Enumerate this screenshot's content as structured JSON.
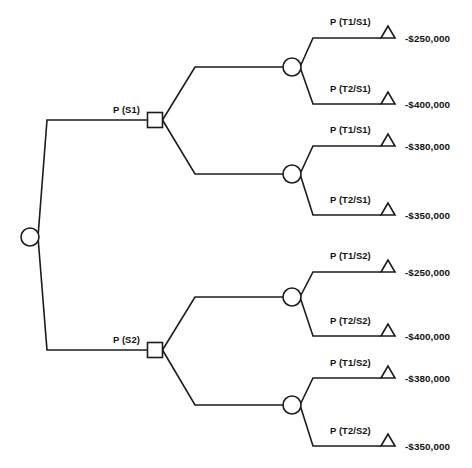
{
  "diagram": {
    "type": "decision-tree",
    "stroke_color": "#1c1c1c",
    "fill_color": "#ffffff",
    "text_color": "#111111",
    "root": {
      "node_name": "root-chance-node",
      "shape": "circle",
      "x": 30,
      "y": 237,
      "r": 9
    },
    "branches": [
      {
        "id": "s1",
        "label": "P (S1)",
        "label_x": 113,
        "label_y": 113,
        "decision_node": {
          "node_name": "decision-node-s1",
          "shape": "square",
          "x": 155,
          "y": 120,
          "size": 15
        },
        "elbow_x": 47,
        "elbow_y": 120,
        "chance_nodes": [
          {
            "node_name": "chance-node-s1-a",
            "shape": "circle",
            "x": 292,
            "y": 67,
            "r": 9,
            "fan_x": 195,
            "outcomes": [
              {
                "node_name": "terminal-s1-t1",
                "label": "P (T1/S1)",
                "label_x": 330,
                "label_y": 25,
                "payoff": "-$250,000",
                "payoff_x": 405,
                "payoff_y": 42,
                "y": 38,
                "corner_x": 313,
                "triangle_x": 388
              },
              {
                "node_name": "terminal-s1-t2",
                "label": "P (T2/S1)",
                "label_x": 330,
                "label_y": 92,
                "payoff": "-$400,000",
                "payoff_x": 405,
                "payoff_y": 108,
                "y": 104,
                "corner_x": 313,
                "triangle_x": 388
              }
            ]
          },
          {
            "node_name": "chance-node-s1-b",
            "shape": "circle",
            "x": 292,
            "y": 174,
            "r": 9,
            "fan_x": 195,
            "outcomes": [
              {
                "node_name": "terminal-s1-t3",
                "label": "P (T1/S1)",
                "label_x": 330,
                "label_y": 133,
                "payoff": "-$380,000",
                "payoff_x": 405,
                "payoff_y": 150,
                "y": 146,
                "corner_x": 313,
                "triangle_x": 388
              },
              {
                "node_name": "terminal-s1-t4",
                "label": "P (T2/S1)",
                "label_x": 330,
                "label_y": 203,
                "payoff": "-$350,000",
                "payoff_x": 405,
                "payoff_y": 219,
                "y": 215,
                "corner_x": 313,
                "triangle_x": 388
              }
            ]
          }
        ]
      },
      {
        "id": "s2",
        "label": "P (S2)",
        "label_x": 113,
        "label_y": 343,
        "decision_node": {
          "node_name": "decision-node-s2",
          "shape": "square",
          "x": 155,
          "y": 350,
          "size": 15
        },
        "elbow_x": 47,
        "elbow_y": 350,
        "chance_nodes": [
          {
            "node_name": "chance-node-s2-a",
            "shape": "circle",
            "x": 292,
            "y": 297,
            "r": 9,
            "fan_x": 195,
            "outcomes": [
              {
                "node_name": "terminal-s2-t1",
                "label": "P (T1/S2)",
                "label_x": 330,
                "label_y": 259,
                "payoff": "-$250,000",
                "payoff_x": 405,
                "payoff_y": 276,
                "y": 272,
                "corner_x": 313,
                "triangle_x": 388
              },
              {
                "node_name": "terminal-s2-t2",
                "label": "P (T2/S2)",
                "label_x": 330,
                "label_y": 324,
                "payoff": "-$400,000",
                "payoff_x": 405,
                "payoff_y": 340,
                "y": 336,
                "corner_x": 313,
                "triangle_x": 388
              }
            ]
          },
          {
            "node_name": "chance-node-s2-b",
            "shape": "circle",
            "x": 292,
            "y": 405,
            "r": 9,
            "fan_x": 195,
            "outcomes": [
              {
                "node_name": "terminal-s2-t3",
                "label": "P (T1/S2)",
                "label_x": 330,
                "label_y": 366,
                "payoff": "-$380,000",
                "payoff_x": 405,
                "payoff_y": 382,
                "y": 378,
                "corner_x": 313,
                "triangle_x": 388
              },
              {
                "node_name": "terminal-s2-t4",
                "label": "P (T2/S2)",
                "label_x": 330,
                "label_y": 434,
                "payoff": "-$350,000",
                "payoff_x": 405,
                "payoff_y": 450,
                "y": 446,
                "corner_x": 313,
                "triangle_x": 388
              }
            ]
          }
        ]
      }
    ]
  }
}
